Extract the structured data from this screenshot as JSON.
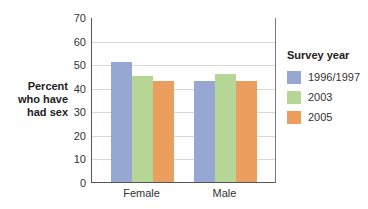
{
  "chart_data": {
    "type": "bar",
    "title": "",
    "xlabel": "",
    "ylabel": "Percent who have had sex",
    "ylabel_lines": [
      "Percent",
      "who have",
      "had sex"
    ],
    "ylim": [
      0,
      70
    ],
    "yticks": [
      0,
      10,
      20,
      30,
      40,
      50,
      60,
      70
    ],
    "grid": true,
    "categories": [
      "Female",
      "Male"
    ],
    "legend_title": "Survey year",
    "legend_position": "right",
    "series": [
      {
        "name": "1996/1997",
        "color": "#97a7d3",
        "values": [
          51,
          43
        ]
      },
      {
        "name": "2003",
        "color": "#b5d694",
        "values": [
          45,
          46
        ]
      },
      {
        "name": "2005",
        "color": "#eb9e5e",
        "values": [
          43,
          43
        ]
      }
    ]
  }
}
